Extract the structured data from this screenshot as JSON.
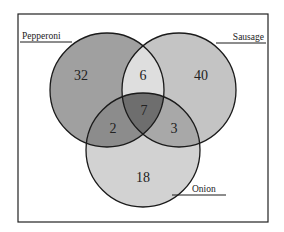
{
  "diagram": {
    "type": "venn-3",
    "sets": [
      {
        "name": "Pepperoni",
        "label": "Pepperoni",
        "only": 32,
        "color": "#a0a0a0"
      },
      {
        "name": "Sausage",
        "label": "Sausage",
        "only": 40,
        "color": "#c4c4c4"
      },
      {
        "name": "Onion",
        "label": "Onion",
        "only": 18,
        "color": "#d2d2d2"
      }
    ],
    "regions": {
      "pepperoni_only": "32",
      "sausage_only": "40",
      "onion_only": "18",
      "pepperoni_sausage": "6",
      "pepperoni_onion": "2",
      "sausage_onion": "3",
      "all_three": "7"
    },
    "region_colors": {
      "pepperoni_sausage": "#dedede",
      "pepperoni_onion": "#8c8c8c",
      "sausage_onion": "#a8a8a8",
      "all_three": "#6e6e6e"
    },
    "labels": {
      "pepperoni": "Pepperoni",
      "sausage": "Sausage",
      "onion": "Onion"
    }
  }
}
